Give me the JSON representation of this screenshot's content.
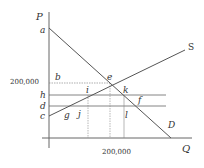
{
  "diagram": {
    "type": "supply-demand",
    "axes": {
      "y_label": "P",
      "x_label": "Q",
      "y_tick_label": "200,000",
      "x_tick_label": "200,000"
    },
    "curves": {
      "demand_label": "D",
      "supply_label": "S"
    },
    "point_labels": {
      "a": "a",
      "b": "b",
      "c": "c",
      "d": "d",
      "e": "e",
      "f": "f",
      "g": "g",
      "h": "h",
      "i": "i",
      "j": "j",
      "k": "k",
      "l": "l"
    },
    "colors": {
      "line": "#555555",
      "text": "#333333",
      "background": "#ffffff"
    }
  }
}
